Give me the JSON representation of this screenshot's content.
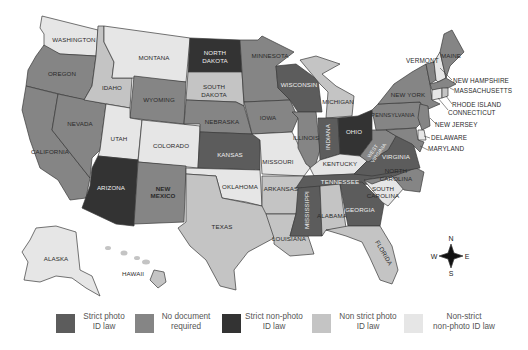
{
  "map": {
    "colors": {
      "strict_photo": "#5c5c5c",
      "no_document": "#858585",
      "strict_non_photo": "#333333",
      "non_strict_photo": "#c4c4c4",
      "non_strict_non_photo": "#e6e6e6"
    },
    "states": [
      {
        "name": "WASHINGTON",
        "category": "non_strict_non_photo"
      },
      {
        "name": "OREGON",
        "category": "no_document"
      },
      {
        "name": "CALIFORNIA",
        "category": "no_document"
      },
      {
        "name": "NEVADA",
        "category": "no_document"
      },
      {
        "name": "IDAHO",
        "category": "non_strict_photo"
      },
      {
        "name": "MONTANA",
        "category": "non_strict_non_photo"
      },
      {
        "name": "WYOMING",
        "category": "no_document"
      },
      {
        "name": "UTAH",
        "category": "non_strict_non_photo"
      },
      {
        "name": "COLORADO",
        "category": "non_strict_non_photo"
      },
      {
        "name": "ARIZONA",
        "category": "strict_non_photo"
      },
      {
        "name": "NEW MEXICO",
        "category": "no_document"
      },
      {
        "name": "NORTH DAKOTA",
        "category": "strict_non_photo"
      },
      {
        "name": "SOUTH DAKOTA",
        "category": "non_strict_photo"
      },
      {
        "name": "NEBRASKA",
        "category": "no_document"
      },
      {
        "name": "KANSAS",
        "category": "strict_photo"
      },
      {
        "name": "OKLAHOMA",
        "category": "non_strict_non_photo"
      },
      {
        "name": "TEXAS",
        "category": "non_strict_photo"
      },
      {
        "name": "MINNESOTA",
        "category": "no_document"
      },
      {
        "name": "IOWA",
        "category": "no_document"
      },
      {
        "name": "MISSOURI",
        "category": "non_strict_non_photo"
      },
      {
        "name": "ARKANSAS",
        "category": "non_strict_photo"
      },
      {
        "name": "LOUISIANA",
        "category": "non_strict_photo"
      },
      {
        "name": "WISCONSIN",
        "category": "strict_photo"
      },
      {
        "name": "ILLINOIS",
        "category": "no_document"
      },
      {
        "name": "MICHIGAN",
        "category": "non_strict_photo"
      },
      {
        "name": "INDIANA",
        "category": "strict_photo"
      },
      {
        "name": "OHIO",
        "category": "strict_non_photo"
      },
      {
        "name": "KENTUCKY",
        "category": "non_strict_non_photo"
      },
      {
        "name": "TENNESSEE",
        "category": "strict_photo"
      },
      {
        "name": "MISSISSIPPI",
        "category": "strict_photo"
      },
      {
        "name": "ALABAMA",
        "category": "non_strict_photo"
      },
      {
        "name": "GEORGIA",
        "category": "strict_photo"
      },
      {
        "name": "FLORIDA",
        "category": "non_strict_photo"
      },
      {
        "name": "SOUTH CAROLINA",
        "category": "non_strict_non_photo"
      },
      {
        "name": "NORTH CAROLINA",
        "category": "no_document"
      },
      {
        "name": "VIRGINIA",
        "category": "strict_photo"
      },
      {
        "name": "WEST VIRGINIA",
        "category": "no_document"
      },
      {
        "name": "PENNSYLVANIA",
        "category": "no_document"
      },
      {
        "name": "NEW YORK",
        "category": "no_document"
      },
      {
        "name": "VERMONT",
        "category": "no_document"
      },
      {
        "name": "MAINE",
        "category": "no_document"
      },
      {
        "name": "NEW HAMPSHIRE",
        "category": "non_strict_non_photo"
      },
      {
        "name": "MASSACHUSETTS",
        "category": "no_document"
      },
      {
        "name": "RHODE ISLAND",
        "category": "non_strict_photo"
      },
      {
        "name": "CONNECTICUT",
        "category": "non_strict_non_photo"
      },
      {
        "name": "NEW JERSEY",
        "category": "no_document"
      },
      {
        "name": "DELAWARE",
        "category": "non_strict_non_photo"
      },
      {
        "name": "MARYLAND",
        "category": "no_document"
      },
      {
        "name": "ALASKA",
        "category": "non_strict_non_photo"
      },
      {
        "name": "HAWAII",
        "category": "non_strict_photo"
      }
    ],
    "labels": {
      "washington": "WASHINGTON",
      "oregon": "OREGON",
      "california": "CALIFORNIA",
      "nevada": "NEVADA",
      "idaho": "IDAHO",
      "montana": "MONTANA",
      "wyoming": "WYOMING",
      "utah": "UTAH",
      "colorado": "COLORADO",
      "arizona": "ARIZONA",
      "new_mexico_1": "NEW",
      "new_mexico_2": "MEXICO",
      "north_dakota_1": "NORTH",
      "north_dakota_2": "DAKOTA",
      "south_dakota_1": "SOUTH",
      "south_dakota_2": "DAKOTA",
      "nebraska": "NEBRASKA",
      "kansas": "KANSAS",
      "oklahoma": "OKLAHOMA",
      "texas": "TEXAS",
      "minnesota": "MINNESOTA",
      "iowa": "IOWA",
      "missouri": "MISSOURI",
      "arkansas": "ARKANSAS",
      "louisiana": "LOUISIANA",
      "wisconsin": "WISCONSIN",
      "illinois": "ILLINOIS",
      "michigan": "MICHIGAN",
      "indiana": "INDIANA",
      "ohio": "OHIO",
      "kentucky": "KENTUCKY",
      "tennessee": "TENNESSEE",
      "mississippi": "MISSISSIPPI",
      "alabama": "ALABAMA",
      "georgia": "GEORGIA",
      "florida": "FLORIDA",
      "south_carolina_1": "SOUTH",
      "south_carolina_2": "CAROLINA",
      "north_carolina_1": "NORTH",
      "north_carolina_2": "CAROLINA",
      "virginia": "VIRGINIA",
      "west_virginia_1": "WEST",
      "west_virginia_2": "VIRGINIA",
      "pennsylvania": "PENNSYLVANIA",
      "new_york": "NEW YORK",
      "vermont": "VERMONT",
      "maine": "MAINE",
      "new_hampshire": "NEW HAMPSHIRE",
      "massachusetts": "MASSACHUSETTS",
      "rhode_island": "RHODE ISLAND",
      "connecticut": "CONNECTICUT",
      "new_jersey": "NEW JERSEY",
      "delaware": "DELAWARE",
      "maryland": "MARYLAND",
      "alaska": "ALASKA",
      "hawaii": "HAWAII"
    },
    "compass": {
      "n": "N",
      "s": "S",
      "e": "E",
      "w": "W"
    }
  },
  "legend": {
    "items": [
      {
        "label": "Strict photo\nID law",
        "color": "#5c5c5c"
      },
      {
        "label": "No document\nrequired",
        "color": "#858585"
      },
      {
        "label": "Strict non-photo\nID law",
        "color": "#333333"
      },
      {
        "label": "Non strict photo\nID law",
        "color": "#c4c4c4"
      },
      {
        "label": "Non-strict\nnon-photo ID law",
        "color": "#e6e6e6"
      }
    ]
  }
}
